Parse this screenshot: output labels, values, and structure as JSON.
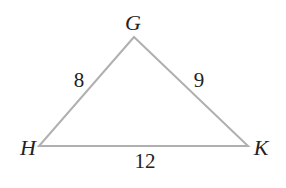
{
  "diagram": {
    "type": "triangle",
    "vertices": [
      {
        "name": "G",
        "x": 134,
        "y": 37,
        "label_x": 133,
        "label_y": 30
      },
      {
        "name": "H",
        "x": 39,
        "y": 146,
        "label_x": 18,
        "label_y": 155
      },
      {
        "name": "K",
        "x": 248,
        "y": 146,
        "label_x": 253,
        "label_y": 155
      }
    ],
    "sides": [
      {
        "from": "H",
        "to": "G",
        "length": "8",
        "label_x": 79,
        "label_y": 87
      },
      {
        "from": "G",
        "to": "K",
        "length": "9",
        "label_x": 199,
        "label_y": 87
      },
      {
        "from": "H",
        "to": "K",
        "length": "12",
        "label_x": 145,
        "label_y": 168
      }
    ],
    "edge_color": "#b0b0b0",
    "text_color": "#222222"
  }
}
